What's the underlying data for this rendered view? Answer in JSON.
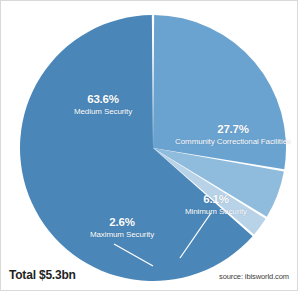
{
  "chart": {
    "title": "",
    "total_label": "Total $5.3bn",
    "source_label": "source: ibisworld.com"
  },
  "labels": {
    "medium": {
      "pct": "63.6%",
      "cat": "Medium Security"
    },
    "community": {
      "pct": "27.7%",
      "cat": "Community Correctional Facilities"
    },
    "minimum": {
      "pct": "6.1%",
      "cat": "Minimum Security"
    },
    "maximum": {
      "pct": "2.6%",
      "cat": "Maximum Security"
    }
  },
  "colors": {
    "medium": "#4a86b8",
    "community": "#6ba3d0",
    "minimum": "#8fbcdd",
    "maximum": "#b8d2e8",
    "separator": "#ffffff",
    "background": "#ffffff",
    "text_dark": "#1f1f1f",
    "text_light": "#ffffff"
  },
  "chart_data": {
    "type": "pie",
    "title": "",
    "categories": [
      "Community Correctional Facilities",
      "Minimum Security",
      "Maximum Security",
      "Medium Security"
    ],
    "values": [
      27.7,
      6.1,
      2.6,
      63.6
    ],
    "value_labels": [
      "27.7%",
      "6.1%",
      "2.6%",
      "63.6%"
    ],
    "colors": [
      "#6ba3d0",
      "#8fbcdd",
      "#b8d2e8",
      "#4a86b8"
    ],
    "units": "percent",
    "total": "Total $5.3bn",
    "total_value": 5.3,
    "total_units": "bn USD",
    "start_angle_deg": 0,
    "direction": "clockwise",
    "legend": "none",
    "labels_position": "inside-slices",
    "annotations": [
      "Total $5.3bn",
      "source: ibisworld.com"
    ],
    "source": "source: ibisworld.com"
  },
  "geometry": {
    "cx": 152,
    "cy": 147,
    "r": 133
  }
}
